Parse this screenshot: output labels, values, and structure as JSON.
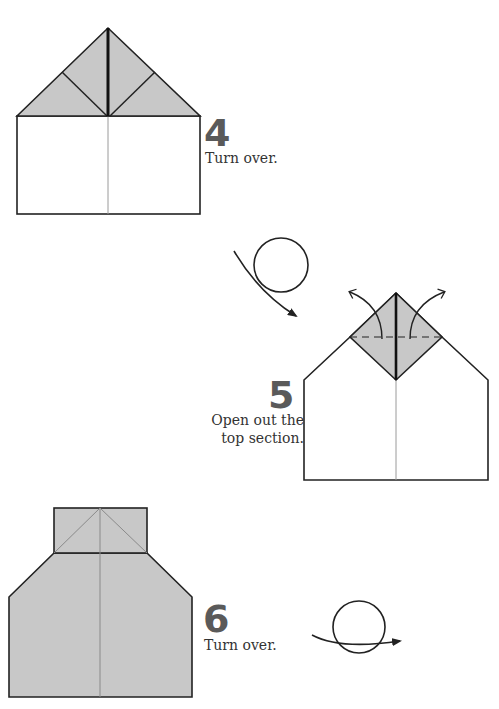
{
  "colors": {
    "paper_fill": "#c8c8c8",
    "outline": "#222222",
    "crease": "#9a9a9a",
    "step_number": "#5a5a5a",
    "text": "#333333"
  },
  "steps": [
    {
      "number": "4",
      "instruction": "Turn over.",
      "icon": "turn-over-arrow-icon"
    },
    {
      "number": "5",
      "instruction_line1": "Open out the",
      "instruction_line2": "top section.",
      "icon": "unfold-arrows-icon"
    },
    {
      "number": "6",
      "instruction": "Turn over.",
      "icon": "turn-over-arrow-icon"
    }
  ]
}
